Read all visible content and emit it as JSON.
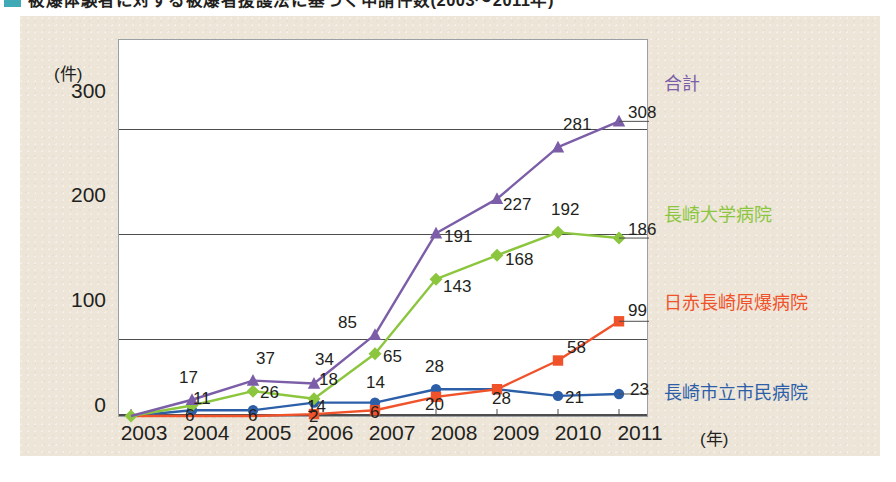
{
  "title": {
    "bullet_color": "#3fa9b5",
    "text": "被爆体験者に対する被爆者援護法に基づく申請件数(2003〜2011年)"
  },
  "axes": {
    "y_unit": "(件)",
    "y_ticks": [
      "300",
      "200",
      "100",
      "0"
    ],
    "y_values": [
      300,
      200,
      100,
      0
    ],
    "x_ticks": [
      "2003",
      "2004",
      "2005",
      "2006",
      "2007",
      "2008",
      "2009",
      "2010",
      "2011"
    ],
    "x_unit": "(年)"
  },
  "legend": [
    {
      "key": "total",
      "label": "合計",
      "color": "#7b5ea7",
      "end_value": "308"
    },
    {
      "key": "nagadai",
      "label": "長崎大学病院",
      "color": "#8cc63e",
      "end_value": "186"
    },
    {
      "key": "nisseki",
      "label": "日赤長崎原爆病院",
      "color": "#f0522a",
      "end_value": "99"
    },
    {
      "key": "shimin",
      "label": "長崎市立市民病院",
      "color": "#2d5fa8",
      "end_value": "23"
    }
  ],
  "chart_data": {
    "type": "line",
    "title": "被爆体験者に対する被爆者援護法に基づく申請件数(2003〜2011年)",
    "xlabel": "(年)",
    "ylabel": "(件)",
    "ylim": [
      0,
      320
    ],
    "grid": true,
    "legend_position": "right",
    "categories": [
      "2003",
      "2004",
      "2005",
      "2006",
      "2007",
      "2008",
      "2009",
      "2010",
      "2011"
    ],
    "series": [
      {
        "name": "合計",
        "color": "#7b5ea7",
        "marker": "triangle",
        "values": [
          0,
          17,
          37,
          34,
          85,
          191,
          227,
          281,
          308
        ],
        "point_labels": [
          "",
          "17",
          "37",
          "34",
          "85",
          "191",
          "227",
          "281",
          "308"
        ]
      },
      {
        "name": "長崎大学病院",
        "color": "#8cc63e",
        "marker": "diamond",
        "values": [
          0,
          11,
          26,
          18,
          65,
          143,
          168,
          192,
          186
        ],
        "point_labels": [
          "",
          "11",
          "26",
          "18",
          "65",
          "143",
          "168",
          "192",
          "186"
        ]
      },
      {
        "name": "日赤長崎原爆病院",
        "color": "#f0522a",
        "marker": "square",
        "values": [
          0,
          0,
          0,
          2,
          6,
          20,
          28,
          58,
          99
        ],
        "point_labels": [
          "",
          "",
          "",
          "2",
          "6",
          "20",
          "",
          "58",
          "99"
        ]
      },
      {
        "name": "長崎市立市民病院",
        "color": "#2d5fa8",
        "marker": "circle",
        "values": [
          0,
          6,
          6,
          14,
          14,
          28,
          28,
          21,
          23
        ],
        "point_labels": [
          "",
          "6",
          "6",
          "14",
          "14",
          "28",
          "28",
          "21",
          "23"
        ]
      }
    ]
  },
  "point_label_layout": [
    {
      "series": "total",
      "idx": 1,
      "text": "17",
      "dx": -12,
      "dy": -22
    },
    {
      "series": "total",
      "idx": 2,
      "text": "37",
      "dx": 4,
      "dy": -22
    },
    {
      "series": "total",
      "idx": 3,
      "text": "34",
      "dx": 2,
      "dy": -23
    },
    {
      "series": "total",
      "idx": 4,
      "text": "85",
      "dx": -36,
      "dy": -12
    },
    {
      "series": "total",
      "idx": 5,
      "text": "191",
      "dx": 9,
      "dy": 4
    },
    {
      "series": "total",
      "idx": 6,
      "text": "227",
      "dx": 7,
      "dy": 6
    },
    {
      "series": "total",
      "idx": 7,
      "text": "281",
      "dx": 6,
      "dy": -22
    },
    {
      "series": "total",
      "idx": 8,
      "text": "308",
      "dx": 10,
      "dy": -8
    },
    {
      "series": "nagadai",
      "idx": 1,
      "text": "11",
      "dx": 2,
      "dy": -6
    },
    {
      "series": "nagadai",
      "idx": 2,
      "text": "26",
      "dx": 8,
      "dy": 2
    },
    {
      "series": "nagadai",
      "idx": 3,
      "text": "18",
      "dx": 6,
      "dy": -19
    },
    {
      "series": "nagadai",
      "idx": 4,
      "text": "65",
      "dx": 9,
      "dy": 3
    },
    {
      "series": "nagadai",
      "idx": 5,
      "text": "143",
      "dx": 8,
      "dy": 8
    },
    {
      "series": "nagadai",
      "idx": 6,
      "text": "168",
      "dx": 9,
      "dy": 5
    },
    {
      "series": "nagadai",
      "idx": 7,
      "text": "192",
      "dx": -6,
      "dy": -22
    },
    {
      "series": "nagadai",
      "idx": 8,
      "text": "186",
      "dx": 10,
      "dy": -8
    },
    {
      "series": "nisseki",
      "idx": 3,
      "text": "2",
      "dx": -4,
      "dy": 3
    },
    {
      "series": "nisseki",
      "idx": 4,
      "text": "6",
      "dx": -4,
      "dy": 3
    },
    {
      "series": "nisseki",
      "idx": 5,
      "text": "20",
      "dx": -10,
      "dy": 8
    },
    {
      "series": "nisseki",
      "idx": 7,
      "text": "58",
      "dx": 10,
      "dy": -13
    },
    {
      "series": "nisseki",
      "idx": 8,
      "text": "99",
      "dx": 10,
      "dy": -10
    },
    {
      "series": "shimin",
      "idx": 1,
      "text": "6",
      "dx": -6,
      "dy": 6
    },
    {
      "series": "shimin",
      "idx": 2,
      "text": "6",
      "dx": -4,
      "dy": 6
    },
    {
      "series": "shimin",
      "idx": 3,
      "text": "14",
      "dx": -6,
      "dy": 4
    },
    {
      "series": "shimin",
      "idx": 4,
      "text": "14",
      "dx": -8,
      "dy": -20
    },
    {
      "series": "shimin",
      "idx": 5,
      "text": "28",
      "dx": -10,
      "dy": -22
    },
    {
      "series": "shimin",
      "idx": 6,
      "text": "28",
      "dx": -4,
      "dy": 10
    },
    {
      "series": "shimin",
      "idx": 7,
      "text": "21",
      "dx": 8,
      "dy": 2
    },
    {
      "series": "shimin",
      "idx": 8,
      "text": "23",
      "dx": 12,
      "dy": -4
    }
  ]
}
